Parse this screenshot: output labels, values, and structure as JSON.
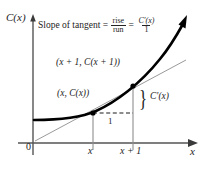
{
  "figure": {
    "type": "math-diagram"
  },
  "axes": {
    "y_label": "C(x)",
    "x_label": "x",
    "origin_label": "0",
    "x_ticks": [
      "x",
      "x + 1"
    ]
  },
  "formula": {
    "lead": "Slope of tangent =",
    "frac1_num": "rise",
    "frac1_den": "run",
    "equals": "=",
    "frac2_num": "C′(x)",
    "frac2_den": "1"
  },
  "annotations": {
    "point_upper": "(x + 1, C(x + 1))",
    "point_lower": "(x, C(x))",
    "run": "1",
    "rise": "C′(x)",
    "brace": "}"
  },
  "colors": {
    "curve": "#000000",
    "tangent": "#8a8a8a",
    "axis": "#555555",
    "guide": "#8a8a8a",
    "dashed": "#1a1a1a",
    "text": "#242424",
    "background": "#ffffff"
  },
  "geometry": {
    "y_axis_x": 33,
    "x_axis_y": 143,
    "point_lower": [
      93,
      113
    ],
    "point_upper": [
      133,
      86
    ],
    "curve_arrow_tip": [
      186,
      17
    ],
    "x_axis_arrow_tip": [
      197,
      143
    ]
  }
}
